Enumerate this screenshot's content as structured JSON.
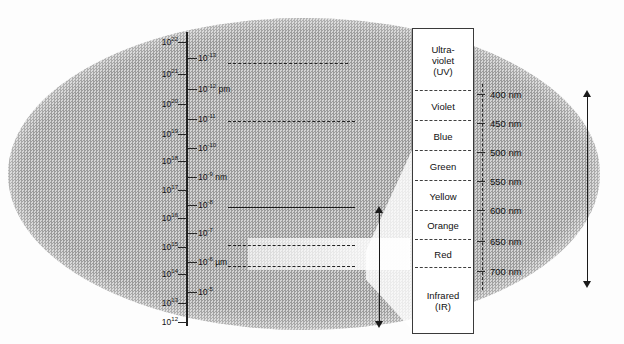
{
  "figure": {
    "blob_color": "#b3b3b3",
    "ink_color": "#1a1a1a"
  },
  "frequency_axis": {
    "name": "frequency-axis",
    "left_labels": [
      {
        "value": "10",
        "exp": "22",
        "y": 42
      },
      {
        "value": "10",
        "exp": "21",
        "y": 74
      },
      {
        "value": "10",
        "exp": "20",
        "y": 104
      },
      {
        "value": "10",
        "exp": "19",
        "y": 134
      },
      {
        "value": "10",
        "exp": "18",
        "y": 161
      },
      {
        "value": "10",
        "exp": "17",
        "y": 190
      },
      {
        "value": "10",
        "exp": "16",
        "y": 218
      },
      {
        "value": "10",
        "exp": "15",
        "y": 247
      },
      {
        "value": "10",
        "exp": "14",
        "y": 274
      },
      {
        "value": "10",
        "exp": "13",
        "y": 303
      },
      {
        "value": "10",
        "exp": "12",
        "y": 322
      }
    ],
    "right_labels": [
      {
        "value": "10",
        "exp": "-13",
        "unit": "",
        "y": 58
      },
      {
        "value": "10",
        "exp": "-12",
        "unit": " pm",
        "y": 89
      },
      {
        "value": "10",
        "exp": "-11",
        "unit": "",
        "y": 119
      },
      {
        "value": "10",
        "exp": "-10",
        "unit": "",
        "y": 148
      },
      {
        "value": "10",
        "exp": "-9",
        "unit": " nm",
        "y": 177
      },
      {
        "value": "10",
        "exp": "-8",
        "unit": "",
        "y": 205
      },
      {
        "value": "10",
        "exp": "-7",
        "unit": "",
        "y": 233
      },
      {
        "value": "10",
        "exp": "-6",
        "unit": " µm",
        "y": 262
      },
      {
        "value": "10",
        "exp": "-5",
        "unit": "",
        "y": 292
      }
    ]
  },
  "sources": [
    {
      "label": "Cosmic Ray",
      "x": 16,
      "y": 52
    },
    {
      "label": "Gamma Ray",
      "x": 16,
      "y": 110
    },
    {
      "label": "X-Ray",
      "x": 30,
      "y": 144
    },
    {
      "label": "Sun Lamps",
      "x": 22,
      "y": 216
    },
    {
      "label": "Illumination",
      "x": 18,
      "y": 254
    }
  ],
  "bands": [
    {
      "label": "Cosmic Ray",
      "x": 243,
      "y": 36
    },
    {
      "label": "Gamma Ray",
      "x": 247,
      "y": 88
    },
    {
      "label": "X-Ray",
      "x": 264,
      "y": 146
    },
    {
      "label": "Ultraviolet",
      "x": 249,
      "y": 230
    },
    {
      "label": "Infrared",
      "x": 255,
      "y": 306
    }
  ],
  "dividers": [
    {
      "name": "cosmic-gamma-divider",
      "x": 228,
      "y": 63,
      "w": 120,
      "style": "dashed"
    },
    {
      "name": "gamma-xray-divider",
      "x": 228,
      "y": 121,
      "w": 127,
      "style": "dashed"
    },
    {
      "name": "xray-uv-divider",
      "x": 228,
      "y": 207,
      "w": 127,
      "style": "solid"
    },
    {
      "name": "uv-visible-divider",
      "x": 228,
      "y": 245,
      "w": 127,
      "style": "dashed"
    },
    {
      "name": "visible-ir-divider",
      "x": 228,
      "y": 266,
      "w": 127,
      "style": "dashed"
    }
  ],
  "vertical_labels": [
    {
      "label": "Radiometry",
      "name": "radiometry-label",
      "x": 362,
      "y": 292
    },
    {
      "label": "Visible Light",
      "name": "visible-light-label",
      "x": 398,
      "y": 268
    },
    {
      "label": "Photometry",
      "name": "photometry-label",
      "x": 578,
      "y": 260
    }
  ],
  "arrows": [
    {
      "name": "radiometry-arrow",
      "x": 375,
      "y": 206,
      "h": 122
    },
    {
      "name": "photometry-arrow",
      "x": 583,
      "y": 90,
      "h": 198
    }
  ],
  "color_table": {
    "name": "visible-spectrum-table",
    "rows": [
      {
        "label": "Ultra-\nviolet\n(UV)",
        "y": 29,
        "h": 62
      },
      {
        "label": "Violet",
        "y": 91,
        "h": 30
      },
      {
        "label": "Blue",
        "y": 121,
        "h": 30
      },
      {
        "label": "Green",
        "y": 151,
        "h": 30
      },
      {
        "label": "Yellow",
        "y": 181,
        "h": 30
      },
      {
        "label": "Orange",
        "y": 211,
        "h": 29
      },
      {
        "label": "Red",
        "y": 240,
        "h": 28
      },
      {
        "label": "Infrared\n(IR)",
        "y": 268,
        "h": 65
      }
    ]
  },
  "wavelength_scale": {
    "name": "wavelength-scale",
    "unit": "nm",
    "ticks": [
      {
        "label": "400 nm",
        "y": 94
      },
      {
        "label": "450 nm",
        "y": 123
      },
      {
        "label": "500 nm",
        "y": 152
      },
      {
        "label": "550 nm",
        "y": 181
      },
      {
        "label": "600 nm",
        "y": 210
      },
      {
        "label": "650 nm",
        "y": 241
      },
      {
        "label": "700 nm",
        "y": 271
      }
    ]
  },
  "chart_data": {
    "type": "table",
    "xlabel": "",
    "ylabel": "Frequency (Hz) / Wavelength (m)",
    "frequency_decades_hz": [
      1e+22,
      1e+21,
      1e+20,
      1e+19,
      1e+18,
      1e+17,
      1e+16,
      1000000000000000.0,
      100000000000000.0,
      10000000000000.0,
      1000000000000.0
    ],
    "wavelength_decades_m": [
      1e-13,
      1e-12,
      1e-11,
      1e-10,
      1e-09,
      1e-08,
      1e-07,
      1e-06,
      1e-05
    ],
    "wavelength_units_marked": {
      "pm": 1e-12,
      "nm": 1e-09,
      "um": 1e-06
    },
    "spectral_bands": [
      "Cosmic Ray",
      "Gamma Ray",
      "X-Ray",
      "Ultraviolet",
      "Visible Light",
      "Infrared"
    ],
    "visible_colors": [
      "Ultra-violet (UV)",
      "Violet",
      "Blue",
      "Green",
      "Yellow",
      "Orange",
      "Red",
      "Infrared (IR)"
    ],
    "visible_wavelengths_nm": [
      400,
      450,
      500,
      550,
      600,
      650,
      700
    ],
    "sources": [
      "Cosmic Ray",
      "Gamma Ray",
      "X-Ray",
      "Sun Lamps",
      "Illumination"
    ],
    "measurement_ranges": [
      "Radiometry",
      "Photometry"
    ],
    "grid": false,
    "legend": "none"
  }
}
